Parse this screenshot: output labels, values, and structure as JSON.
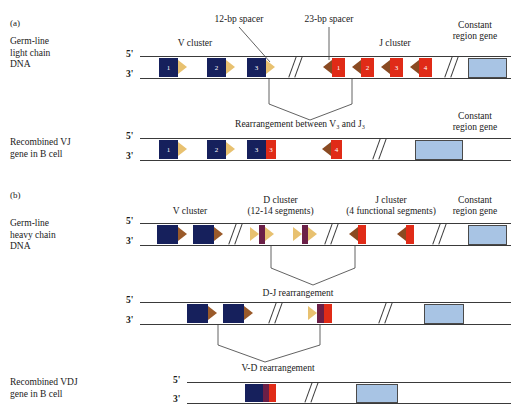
{
  "figure": {
    "panels": [
      {
        "letter": "(a)",
        "row_label": "Germ-line\nlight chain\nDNA",
        "cluster_labels": {
          "v": "V cluster",
          "j": "J cluster",
          "constant": "Constant\nregion gene"
        },
        "spacers": {
          "twelve": "12-bp spacer",
          "twentythree": "23-bp spacer"
        },
        "strand_labels": {
          "five": "5'",
          "three": "3'"
        },
        "v_segments": [
          "1",
          "2",
          "3"
        ],
        "j_segments": [
          "1",
          "2",
          "3",
          "4"
        ]
      },
      {
        "letter": "",
        "row_label": "Recombined VJ\ngene in B cell",
        "rearrangement_label": "Rearrangement between V₃ and J₃",
        "constant_label": "Constant\nregion gene",
        "strand_labels": {
          "five": "5'",
          "three": "3'"
        },
        "v_segments": [
          "1",
          "2",
          "3"
        ],
        "joined_j": "3",
        "remaining_j": "4"
      },
      {
        "letter": "(b)",
        "row_label": "Germ-line\nheavy chain\nDNA",
        "cluster_labels": {
          "v": "V cluster",
          "d": "D cluster\n(12-14 segments)",
          "j": "J cluster\n(4 functional segments)",
          "constant": "Constant\nregion gene"
        },
        "strand_labels": {
          "five": "5'",
          "three": "3'"
        },
        "v_count": 2,
        "d_count": 2,
        "j_count": 2
      },
      {
        "letter": "",
        "row_label": "",
        "rearrangement_label": "D-J rearrangement",
        "strand_labels": {
          "five": "5'",
          "three": "3'"
        }
      },
      {
        "letter": "",
        "row_label": "Recombined VDJ\ngene in B cell",
        "rearrangement_label": "V-D rearrangement",
        "strand_labels": {
          "five": "5'",
          "three": "3'"
        }
      }
    ],
    "colors": {
      "v_segment": "#16205c",
      "j_segment": "#e02b17",
      "d_segment": "#6b1f47",
      "constant_region": "#a8c4e4",
      "spacer_12bp": "#e8c170",
      "spacer_23bp": "#8a4a22",
      "strand_line": "#3a3a3a",
      "text": "#1a1a1a"
    }
  }
}
